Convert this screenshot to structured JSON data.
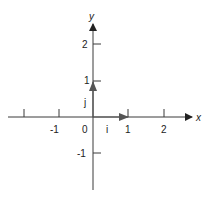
{
  "diagram": {
    "x_axis": {
      "label": "x",
      "ticks": [
        "-1",
        "0",
        "1",
        "2"
      ]
    },
    "y_axis": {
      "label": "y",
      "ticks": [
        "2",
        "1",
        "-1"
      ]
    },
    "vectors": [
      {
        "label": "i",
        "from": [
          0,
          0
        ],
        "to": [
          1,
          0
        ]
      },
      {
        "label": "j",
        "from": [
          0,
          0
        ],
        "to": [
          0,
          1
        ]
      }
    ],
    "colors": {
      "axis": "#3a3a3a",
      "vector": "#555555",
      "text": "#222222"
    }
  }
}
